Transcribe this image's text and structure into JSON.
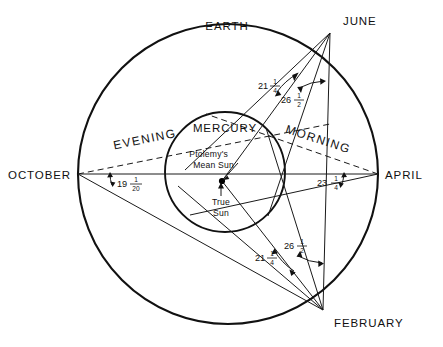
{
  "figure": {
    "title_bodies": {
      "outer_orbit_label": "EARTH",
      "inner_orbit_label": "MERCURY"
    },
    "center_labels": {
      "mean_sun": "Ptolemy's",
      "mean_sun_line2": "Mean Sun",
      "true_sun": "True",
      "true_sun_line2": "Sun"
    },
    "months": [
      {
        "name": "EARTH",
        "position": "top"
      },
      {
        "name": "JUNE",
        "position": "upper-right"
      },
      {
        "name": "APRIL",
        "position": "right"
      },
      {
        "name": "FEBRUARY",
        "position": "lower-right"
      },
      {
        "name": "OCTOBER",
        "position": "left"
      }
    ],
    "elongation_periods": [
      {
        "label": "EVENING",
        "side": "left"
      },
      {
        "label": "MORNING",
        "side": "right"
      }
    ],
    "angles": [
      {
        "id": "june-outer",
        "whole": "21",
        "num": "1",
        "den": "4",
        "text": "21 1/4"
      },
      {
        "id": "june-inner",
        "whole": "26",
        "num": "1",
        "den": "2",
        "text": "26 1/2"
      },
      {
        "id": "february-outer",
        "whole": "21",
        "num": "1",
        "den": "4",
        "text": "21 1/4"
      },
      {
        "id": "february-inner",
        "whole": "26",
        "num": "1",
        "den": "2",
        "text": "26 1/2"
      },
      {
        "id": "october",
        "whole": "19",
        "num": "1",
        "den": "20",
        "text": "19 1/20"
      },
      {
        "id": "april",
        "whole": "23",
        "num": "1",
        "den": "4",
        "text": "23 1/4"
      }
    ],
    "colors": {
      "ink": "#111111",
      "background": "#ffffff"
    }
  }
}
